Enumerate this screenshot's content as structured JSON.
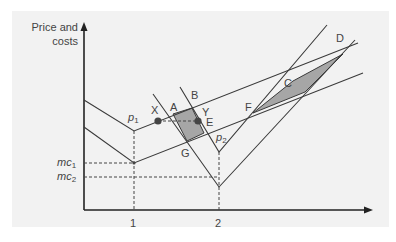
{
  "diagram": {
    "y_axis_label_line1": "Price and",
    "y_axis_label_line2": "costs",
    "x_ticks": [
      "1",
      "2"
    ],
    "y_ticks": {
      "mc1": {
        "base": "mc",
        "sub": "1"
      },
      "mc2": {
        "base": "mc",
        "sub": "2"
      }
    },
    "price_labels": {
      "p1": {
        "base": "p",
        "sub": "1"
      },
      "p2": {
        "base": "p",
        "sub": "2"
      }
    },
    "points": [
      "X",
      "A",
      "B",
      "Y",
      "E",
      "G",
      "F",
      "C",
      "D"
    ],
    "point_labels": {
      "X": "X",
      "A": "A",
      "B": "B",
      "Y": "Y",
      "E": "E",
      "G": "G",
      "F": "F",
      "C": "C",
      "D": "D"
    },
    "colors": {
      "background": "#f2f2f2",
      "line": "#3a3a3a",
      "shade": "#a6a6a6",
      "dot": "#444444"
    }
  }
}
